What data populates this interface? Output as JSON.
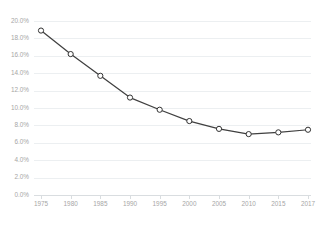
{
  "chart_data": {
    "type": "line",
    "title": "",
    "subtitle": "",
    "xlabel": "",
    "ylabel": "",
    "categories": [
      "1975",
      "1980",
      "1985",
      "1990",
      "1995",
      "2000",
      "2005",
      "2010",
      "2015",
      "2017"
    ],
    "x": [
      1975,
      1980,
      1985,
      1990,
      1995,
      2000,
      2005,
      2010,
      2015,
      2017
    ],
    "values": [
      18.9,
      16.2,
      13.7,
      11.2,
      9.8,
      8.5,
      7.6,
      7.0,
      7.2,
      7.5
    ],
    "value_labels": [
      "18.9%",
      "16.2%",
      "13.7%",
      "11.2%",
      "9.8%",
      "8.5%",
      "7.6%",
      "7.0%",
      "7.2%",
      "7.5%"
    ],
    "ylim": [
      0,
      20
    ],
    "ytick_values": [
      0,
      2,
      4,
      6,
      8,
      10,
      12,
      14,
      16,
      18,
      20
    ],
    "ytick_labels": [
      "0.0%",
      "2.0%",
      "4.0%",
      "6.0%",
      "8.0%",
      "10.0%",
      "12.0%",
      "14.0%",
      "16.0%",
      "18.0%",
      "20.0%"
    ],
    "xtick_labels": [
      "1975",
      "1980",
      "1985",
      "1990",
      "1995",
      "2000",
      "2005",
      "2010",
      "2015",
      "2017"
    ],
    "grid": true,
    "grid_axis": "y",
    "legend": false,
    "legend_position": "none",
    "series": [
      {
        "name": "",
        "values": [
          18.9,
          16.2,
          13.7,
          11.2,
          9.8,
          8.5,
          7.6,
          7.0,
          7.2,
          7.5
        ],
        "marker": "circle-open",
        "line_color": "#404040",
        "marker_fill": "#ffffff",
        "marker_stroke": "#333333"
      }
    ],
    "colors": {
      "line": "#404040",
      "grid": "#eceff1",
      "axis": "#d9dde0",
      "tick_text": "#a6a6a6",
      "background": "#ffffff",
      "marker_fill": "#ffffff",
      "marker_stroke": "#333333"
    }
  }
}
